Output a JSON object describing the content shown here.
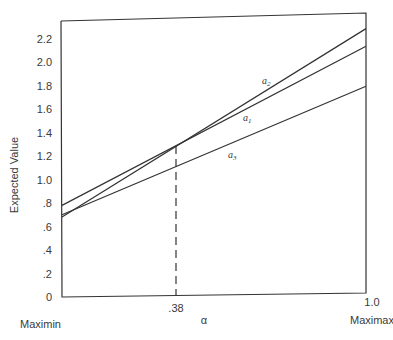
{
  "chart_data": {
    "type": "line",
    "title": "",
    "xlabel": "α",
    "ylabel": "Expected Value",
    "x_left_label": "Maximin",
    "x_right_label": "Maximax",
    "x_ticks": [
      ".38",
      "1.0"
    ],
    "y_ticks": [
      "0",
      ".2",
      ".4",
      ".6",
      ".8",
      "1.0",
      "1.2",
      "1.4",
      "1.6",
      "1.8",
      "2.0",
      "2.2"
    ],
    "xlim": [
      0,
      1.0
    ],
    "ylim": [
      0,
      2.3
    ],
    "grid": false,
    "legend": "inline labels",
    "series": [
      {
        "name": "a2",
        "label_main": "a",
        "label_sub": "2",
        "x": [
          0,
          1.0
        ],
        "y": [
          0.68,
          2.25
        ]
      },
      {
        "name": "a1",
        "label_main": "a",
        "label_sub": "1",
        "x": [
          0,
          1.0
        ],
        "y": [
          0.78,
          2.1
        ]
      },
      {
        "name": "a3",
        "label_main": "a",
        "label_sub": "3",
        "x": [
          0,
          1.0
        ],
        "y": [
          0.7,
          1.76
        ]
      }
    ],
    "annotations": [
      {
        "type": "dashed-vertical",
        "x": 0.38,
        "y_top": 1.28,
        "label": ".38"
      }
    ]
  }
}
